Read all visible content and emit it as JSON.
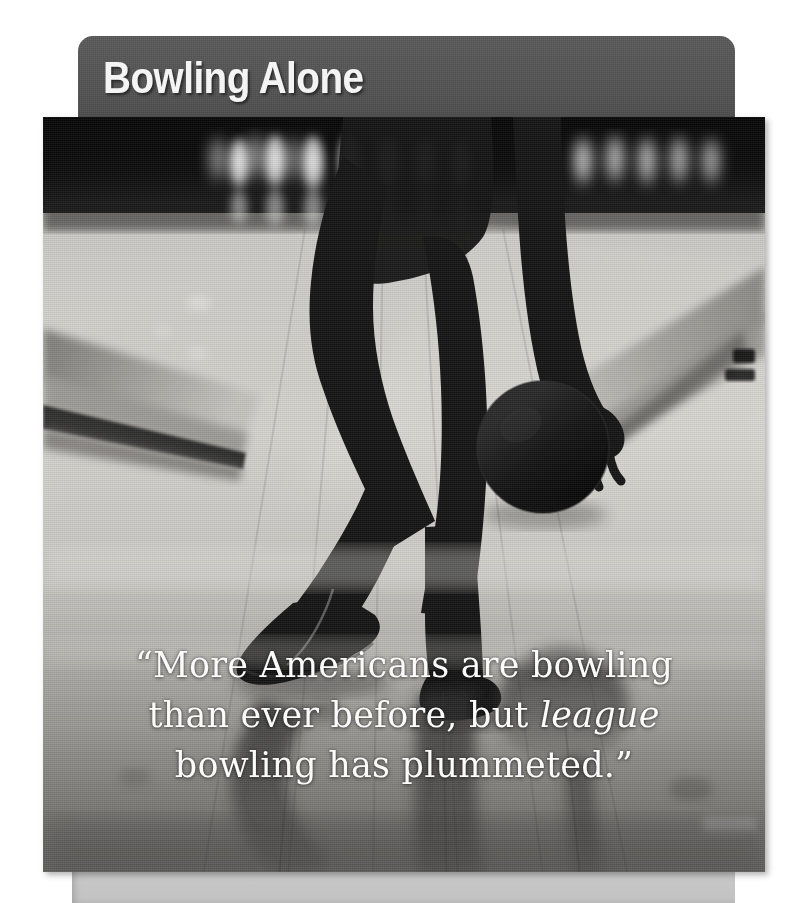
{
  "header": {
    "title": "Bowling Alone",
    "bar_color": "#555555",
    "title_color": "#f4f4f4"
  },
  "photo": {
    "alt_name": "bowler-silhouette-photo",
    "description": "Black and white photograph of a bowler's legs and hand releasing a bowling ball on a lit lane with pins in the background and reflections on the polished floor",
    "palette": {
      "dark_background": "#0d0d0d",
      "lane_light": "#d8d6d2",
      "lane_mid": "#a8a6a2",
      "silhouette": "#171717",
      "gutter": "#6e6c69"
    }
  },
  "quote": {
    "line1": "“More Americans are bowling",
    "line2_pre": "than ever before, but ",
    "line2_em": "league",
    "line3": "bowling has plummeted.”",
    "text_color": "#fbfbfb"
  },
  "bottom_panel": {
    "color": "#c6c6c6"
  }
}
